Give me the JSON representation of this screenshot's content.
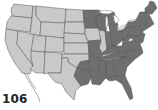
{
  "figure": {
    "number": "106"
  },
  "legend_colors": {
    "light": "#c9c9c9",
    "dark": "#6f6f6f",
    "border": "#555555",
    "background": "#ffffff"
  },
  "regions": {
    "light_states": [
      "WA",
      "OR",
      "CA",
      "NV",
      "ID",
      "MT",
      "WY",
      "UT",
      "AZ",
      "CO",
      "NM",
      "ND",
      "SD",
      "NE",
      "KS",
      "IA",
      "IL",
      "western TX",
      "western OK"
    ],
    "dark_states": [
      "MN",
      "WI",
      "MI",
      "IN",
      "OH",
      "KY",
      "TN",
      "MO (east)",
      "AR",
      "LA",
      "eastern TX",
      "eastern OK",
      "MS",
      "AL",
      "GA",
      "FL",
      "SC",
      "NC",
      "VA",
      "WV",
      "PA",
      "NY",
      "NJ",
      "DE",
      "MD",
      "CT",
      "RI",
      "MA",
      "VT",
      "NH",
      "ME"
    ]
  }
}
